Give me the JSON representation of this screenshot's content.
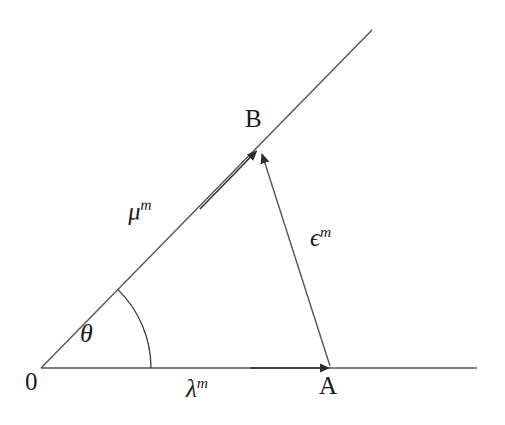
{
  "figure": {
    "type": "geometric-vector-diagram",
    "background_color": "#ffffff",
    "stroke_color": "#3a3a3a",
    "text_color": "#1a1a1a",
    "width": 505,
    "height": 425
  },
  "points": {
    "origin": {
      "label": "0",
      "x": 41,
      "y": 368
    },
    "a": {
      "label": "A",
      "x": 330,
      "y": 368
    },
    "b": {
      "label": "B",
      "x": 258,
      "y": 149
    }
  },
  "vectors": [
    {
      "name": "lambda",
      "label_base": "λ",
      "label_sup": "m",
      "from": "origin",
      "to": "a",
      "arrow": true,
      "description": "horizontal vector from origin to A"
    },
    {
      "name": "mu",
      "label_base": "μ",
      "label_sup": "m",
      "from": "origin",
      "to": "b",
      "arrow": true,
      "description": "vector from origin along inclined ray to B"
    },
    {
      "name": "epsilon",
      "label_base": "ϵ",
      "label_sup": "m",
      "from": "a",
      "to": "b",
      "arrow": true,
      "description": "vector from A to B"
    }
  ],
  "angle": {
    "label": "θ",
    "vertex": "origin",
    "between": [
      "lambda",
      "mu"
    ],
    "degrees": 45.6,
    "arc_radius": 110
  },
  "rays": [
    {
      "name": "horizontal-axis",
      "from_x": 41,
      "from_y": 368,
      "to_x": 477,
      "to_y": 368
    },
    {
      "name": "inclined-ray",
      "from_x": 41,
      "from_y": 368,
      "to_x": 372,
      "to_y": 30
    }
  ]
}
